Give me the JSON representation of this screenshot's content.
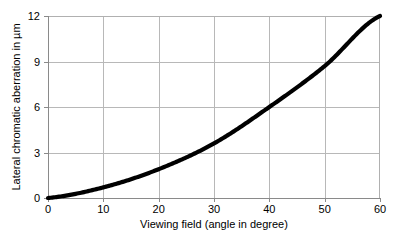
{
  "chart_data": {
    "type": "line",
    "title": "",
    "subtitle": "",
    "xlabel": "Viewing field (angle in degree)",
    "ylabel": "Lateral chromatic aberration in µm",
    "x": [
      0,
      10,
      20,
      30,
      40,
      50,
      60
    ],
    "series": [
      {
        "name": "Lateral chromatic aberration",
        "values": [
          0,
          0.7,
          1.9,
          3.6,
          6.0,
          8.7,
          12.0
        ],
        "color": "#000000"
      }
    ],
    "xlim": [
      0,
      60
    ],
    "ylim": [
      0,
      12
    ],
    "xticks": [
      0,
      10,
      20,
      30,
      40,
      50,
      60
    ],
    "yticks": [
      0,
      3,
      6,
      9,
      12
    ],
    "xtick_labels": [
      "0",
      "10",
      "20",
      "30",
      "40",
      "50",
      "60"
    ],
    "ytick_labels": [
      "0",
      "3",
      "6",
      "9",
      "12"
    ],
    "grid": true,
    "grid_axis": "y",
    "legend": false,
    "legend_position": "none",
    "annotations": []
  },
  "figure": {
    "background_color": "#ffffff",
    "grid_color": "#b8b8b8",
    "axis_color": "#8a8a8a",
    "curve_color": "#000000"
  }
}
